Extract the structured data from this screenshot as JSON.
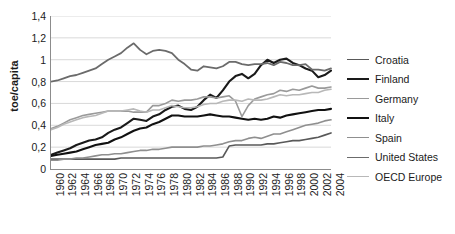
{
  "chart_data": {
    "type": "line",
    "title": "",
    "xlabel": "",
    "ylabel": "toe/capita",
    "ylim": [
      0,
      1.4
    ],
    "ytick_step": 0.2,
    "grid": true,
    "legend_position": "right",
    "decimal_separator": ",",
    "y_ticks": [
      "1,4",
      "1,2",
      "1",
      "0,8",
      "0,6",
      "0,4",
      "0,2",
      "0"
    ],
    "y_tick_values": [
      1.4,
      1.2,
      1.0,
      0.8,
      0.6,
      0.4,
      0.2,
      0
    ],
    "x_ticks": [
      "1960",
      "1962",
      "1964",
      "1966",
      "1968",
      "1970",
      "1972",
      "1974",
      "1976",
      "1978",
      "1980",
      "1982",
      "1984",
      "1986",
      "1988",
      "1990",
      "1992",
      "1994",
      "1996",
      "1998",
      "2000",
      "2002",
      "2004"
    ],
    "x": [
      1960,
      1961,
      1962,
      1963,
      1964,
      1965,
      1966,
      1967,
      1968,
      1969,
      1970,
      1971,
      1972,
      1973,
      1974,
      1975,
      1976,
      1977,
      1978,
      1979,
      1980,
      1981,
      1982,
      1983,
      1984,
      1985,
      1986,
      1987,
      1988,
      1989,
      1990,
      1991,
      1992,
      1993,
      1994,
      1995,
      1996,
      1997,
      1998,
      1999,
      2000,
      2001,
      2002,
      2003,
      2004
    ],
    "xlim": [
      1960,
      2004
    ],
    "series": [
      {
        "name": "Croatia",
        "color": "#595959",
        "width": 1.6,
        "values": [
          0.09,
          0.09,
          0.09,
          0.09,
          0.09,
          0.09,
          0.09,
          0.09,
          0.09,
          0.09,
          0.09,
          0.1,
          0.1,
          0.1,
          0.1,
          0.1,
          0.1,
          0.1,
          0.1,
          0.1,
          0.1,
          0.1,
          0.1,
          0.1,
          0.1,
          0.1,
          0.1,
          0.11,
          0.21,
          0.22,
          0.22,
          0.22,
          0.22,
          0.22,
          0.23,
          0.23,
          0.24,
          0.25,
          0.26,
          0.26,
          0.27,
          0.28,
          0.29,
          0.31,
          0.33
        ]
      },
      {
        "name": "Finland",
        "color": "#1a1a1a",
        "width": 2.1,
        "values": [
          0.13,
          0.15,
          0.17,
          0.19,
          0.22,
          0.24,
          0.26,
          0.27,
          0.29,
          0.33,
          0.36,
          0.38,
          0.42,
          0.46,
          0.45,
          0.44,
          0.48,
          0.5,
          0.54,
          0.57,
          0.58,
          0.55,
          0.54,
          0.57,
          0.63,
          0.68,
          0.65,
          0.72,
          0.8,
          0.85,
          0.87,
          0.83,
          0.87,
          0.95,
          1.0,
          0.97,
          1.0,
          1.01,
          0.97,
          0.95,
          0.92,
          0.9,
          0.84,
          0.86,
          0.9
        ]
      },
      {
        "name": "Germany",
        "color": "#9a9a9a",
        "width": 1.6,
        "values": [
          0.37,
          0.39,
          0.42,
          0.45,
          0.47,
          0.49,
          0.5,
          0.51,
          0.52,
          0.53,
          0.53,
          0.53,
          0.53,
          0.52,
          0.52,
          0.52,
          0.58,
          0.58,
          0.6,
          0.63,
          0.62,
          0.63,
          0.63,
          0.64,
          0.66,
          0.66,
          0.65,
          0.66,
          0.67,
          0.62,
          0.48,
          0.58,
          0.64,
          0.66,
          0.68,
          0.69,
          0.72,
          0.71,
          0.73,
          0.72,
          0.74,
          0.76,
          0.74,
          0.74,
          0.75
        ]
      },
      {
        "name": "Italy",
        "color": "#111111",
        "width": 2.1,
        "values": [
          0.12,
          0.13,
          0.14,
          0.15,
          0.16,
          0.18,
          0.2,
          0.22,
          0.23,
          0.24,
          0.27,
          0.29,
          0.32,
          0.35,
          0.37,
          0.38,
          0.41,
          0.43,
          0.46,
          0.49,
          0.49,
          0.48,
          0.48,
          0.48,
          0.49,
          0.5,
          0.49,
          0.48,
          0.48,
          0.47,
          0.46,
          0.45,
          0.46,
          0.45,
          0.46,
          0.48,
          0.47,
          0.49,
          0.5,
          0.51,
          0.52,
          0.53,
          0.54,
          0.54,
          0.55
        ]
      },
      {
        "name": "Spain",
        "color": "#8f8f8f",
        "width": 1.6,
        "values": [
          0.08,
          0.08,
          0.09,
          0.09,
          0.1,
          0.1,
          0.11,
          0.12,
          0.13,
          0.13,
          0.14,
          0.14,
          0.15,
          0.16,
          0.17,
          0.17,
          0.18,
          0.18,
          0.19,
          0.2,
          0.2,
          0.2,
          0.2,
          0.2,
          0.21,
          0.21,
          0.22,
          0.23,
          0.25,
          0.26,
          0.26,
          0.28,
          0.29,
          0.28,
          0.3,
          0.32,
          0.32,
          0.34,
          0.36,
          0.38,
          0.4,
          0.41,
          0.42,
          0.44,
          0.45
        ]
      },
      {
        "name": "United States",
        "color": "#6b6b6b",
        "width": 1.8,
        "values": [
          0.8,
          0.81,
          0.83,
          0.85,
          0.86,
          0.88,
          0.9,
          0.92,
          0.96,
          1.0,
          1.03,
          1.06,
          1.11,
          1.15,
          1.09,
          1.05,
          1.08,
          1.09,
          1.08,
          1.06,
          1.0,
          0.96,
          0.91,
          0.9,
          0.94,
          0.93,
          0.92,
          0.94,
          0.98,
          0.98,
          0.96,
          0.95,
          0.96,
          0.96,
          0.97,
          0.95,
          0.98,
          0.97,
          0.95,
          0.95,
          0.96,
          0.91,
          0.91,
          0.9,
          0.92
        ]
      },
      {
        "name": "OECD Europe",
        "color": "#b8b8b8",
        "width": 1.6,
        "values": [
          0.36,
          0.38,
          0.41,
          0.43,
          0.45,
          0.47,
          0.48,
          0.49,
          0.51,
          0.53,
          0.53,
          0.53,
          0.54,
          0.55,
          0.53,
          0.52,
          0.54,
          0.54,
          0.56,
          0.58,
          0.57,
          0.56,
          0.56,
          0.57,
          0.59,
          0.6,
          0.6,
          0.62,
          0.63,
          0.63,
          0.62,
          0.64,
          0.63,
          0.63,
          0.64,
          0.66,
          0.68,
          0.67,
          0.68,
          0.68,
          0.69,
          0.7,
          0.7,
          0.72,
          0.73
        ]
      }
    ]
  },
  "legend": {
    "items": [
      {
        "label": "Croatia"
      },
      {
        "label": "Finland"
      },
      {
        "label": "Germany"
      },
      {
        "label": "Italy"
      },
      {
        "label": "Spain"
      },
      {
        "label": "United States"
      },
      {
        "label": "OECD Europe"
      }
    ]
  },
  "colors": {
    "gridline": "#d9d9d9",
    "axis": "#8c8c8c",
    "text": "#1a1a1a",
    "background": "#ffffff"
  }
}
